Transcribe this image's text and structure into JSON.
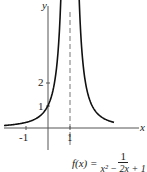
{
  "chart_data": {
    "type": "line",
    "title": "",
    "function_label": "f(x) =",
    "numerator": "1",
    "denominator": "x² − 2x + 1",
    "xlabel": "x",
    "ylabel": "y",
    "x_ticks": [
      {
        "value": -1,
        "label": "-1"
      },
      {
        "value": 1,
        "label": "1"
      }
    ],
    "y_ticks": [
      {
        "value": 1,
        "label": "1"
      },
      {
        "value": 2,
        "label": "2"
      }
    ],
    "asymptote": {
      "x": 1,
      "style": "dashed"
    },
    "xlim": [
      -2.1,
      3.1
    ],
    "ylim": [
      -1.1,
      5.8
    ],
    "grid": false,
    "series": [
      {
        "name": "f(x) = 1/(x-1)^2",
        "x": [
          -2,
          -1.5,
          -1,
          -0.5,
          0,
          0.25,
          0.5,
          0.58
        ],
        "values": [
          0.11,
          0.16,
          0.25,
          0.44,
          1,
          1.78,
          4,
          5.7
        ]
      },
      {
        "name": "f(x) = 1/(x-1)^2 (right branch)",
        "x": [
          1.42,
          1.5,
          1.75,
          2,
          2.5,
          3
        ],
        "values": [
          5.7,
          4,
          1.78,
          1,
          0.44,
          0.25
        ]
      }
    ]
  }
}
